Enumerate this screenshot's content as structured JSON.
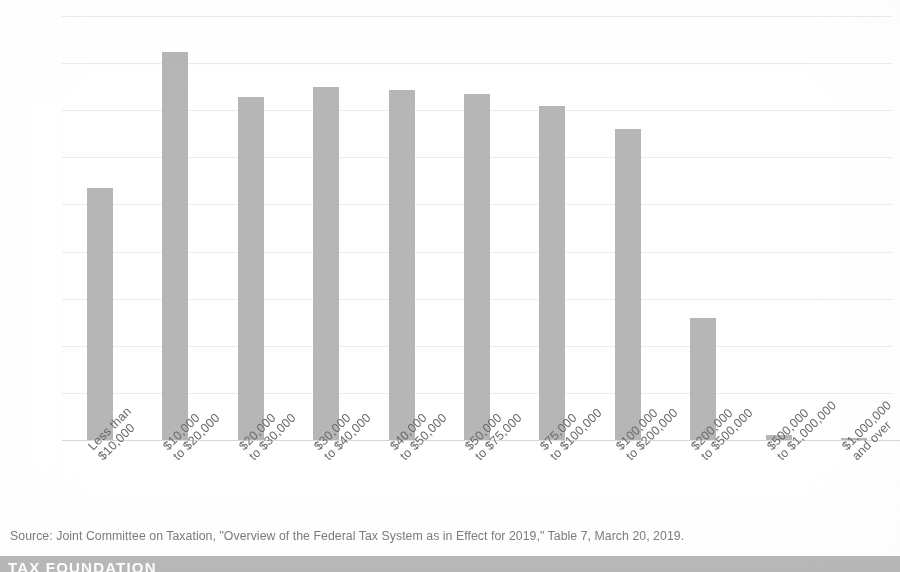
{
  "chart_data": {
    "type": "bar",
    "title": "",
    "subtitle": "",
    "xlabel": "",
    "ylabel": "",
    "ylim": [
      0,
      90
    ],
    "grid": true,
    "legend": "none",
    "y_ticks": [
      "0%",
      "10%",
      "20%",
      "30%",
      "40%",
      "50%",
      "60%",
      "70%",
      "80%",
      "90%"
    ],
    "y_tick_values": [
      0,
      10,
      20,
      30,
      40,
      50,
      60,
      70,
      80,
      90
    ],
    "categories": [
      "Less than $10,000",
      "$10,000 to $20,000",
      "$20,000 to $30,000",
      "$30,000 to $40,000",
      "$40,000 to $50,000",
      "$50,000 to $75,000",
      "$75,000 to $100,000",
      "$100,000 to $200,000",
      "$200,000 to $500,000",
      "$500,000 to $1,000,000",
      "$1,000,000 and over"
    ],
    "category_label_lines": [
      [
        "Less than",
        "$10,000"
      ],
      [
        "$10,000",
        "to $20,000"
      ],
      [
        "$20,000",
        "to $30,000"
      ],
      [
        "$30,000",
        "to $40,000"
      ],
      [
        "$40,000",
        "to $50,000"
      ],
      [
        "$50,000",
        "to $75,000"
      ],
      [
        "$75,000",
        "to $100,000"
      ],
      [
        "$100,000",
        "to $200,000"
      ],
      [
        "$200,000",
        "to $500,000"
      ],
      [
        "$500,000",
        "to $1,000,000"
      ],
      [
        "$1,000,000",
        "and over"
      ]
    ],
    "values": [
      53.5,
      82.3,
      72.8,
      75.0,
      74.2,
      73.5,
      70.8,
      66.0,
      25.8,
      1.0,
      0.3
    ],
    "bar_color": "#b6b6b6"
  },
  "source": {
    "text": "Source: Joint Committee on Taxation, \"Overview of the Federal Tax System as in Effect for 2019,\" Table 7, March 20, 2019."
  },
  "footer": {
    "logo_text": "TAX FOUNDATION",
    "band_color": "#b9b9b9"
  }
}
